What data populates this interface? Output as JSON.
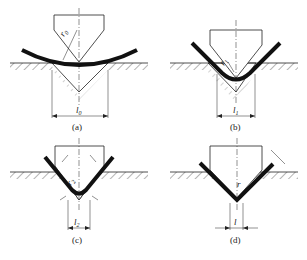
{
  "figure": {
    "panels": [
      {
        "id": "a",
        "caption": "(a)",
        "radius_label": "r",
        "radius_sub": "0",
        "width_label": "l",
        "width_sub": "0"
      },
      {
        "id": "b",
        "caption": "(b)",
        "radius_label": "r",
        "radius_sub": "1",
        "width_label": "l",
        "width_sub": "1"
      },
      {
        "id": "c",
        "caption": "(c)",
        "radius_label": "r",
        "radius_sub": "2",
        "width_label": "l",
        "width_sub": "2"
      },
      {
        "id": "d",
        "caption": "(d)",
        "radius_label": "r",
        "radius_sub": "",
        "width_label": "l",
        "width_sub": ""
      }
    ],
    "colors": {
      "line": "#222222",
      "sheet": "#111111",
      "hatch": "#444444"
    }
  }
}
